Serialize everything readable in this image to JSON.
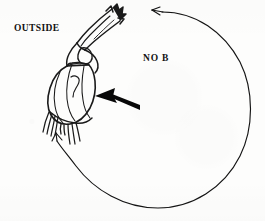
{
  "figure": {
    "kind": "scanned-line-drawing",
    "background_color": "#fdfdfc",
    "ink_color": "#111111",
    "width": 265,
    "height": 221,
    "labels": {
      "outside": "OUTSIDE",
      "no_b": "NO B"
    },
    "annotations": {
      "pointer_arrow": {
        "name": "bold-pointer-arrow",
        "direction": "left",
        "description": "thick solid black arrow pointing left toward the lower body of the organism"
      },
      "flow_circle": {
        "name": "circular-flow-arc",
        "direction": "counterclockwise",
        "arrowhead_count": 2,
        "arrowhead_positions": [
          "top",
          "lower-left"
        ]
      },
      "organism": {
        "name": "crustacean-line-drawing",
        "orientation": "diagonal, tip at upper right, body at lower left",
        "features": [
          "spiked tail fan",
          "segmented carapace",
          "thin legs",
          "abdominal appendages"
        ]
      }
    }
  }
}
